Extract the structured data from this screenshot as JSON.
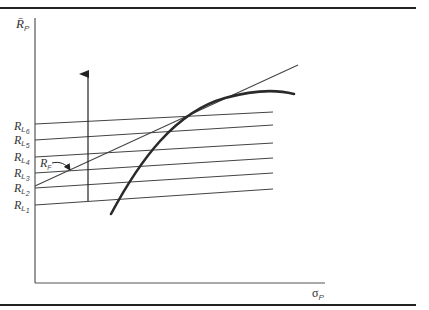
{
  "figure": {
    "y_axis_label": "R̄",
    "y_axis_sub": "P",
    "x_axis_label": "σ",
    "x_axis_sub": "P",
    "riskfree_label": "R",
    "riskfree_sub": "F",
    "lending_rates": [
      {
        "label": "R",
        "sub": "L",
        "index": "6"
      },
      {
        "label": "R",
        "sub": "L",
        "index": "5"
      },
      {
        "label": "R",
        "sub": "L",
        "index": "4"
      },
      {
        "label": "R",
        "sub": "L",
        "index": "3"
      },
      {
        "label": "R",
        "sub": "L",
        "index": "2"
      },
      {
        "label": "R",
        "sub": "L",
        "index": "1"
      }
    ]
  },
  "colors": {
    "ink": "#333333",
    "rule": "#222222",
    "frontier": "#2a2a2a"
  }
}
